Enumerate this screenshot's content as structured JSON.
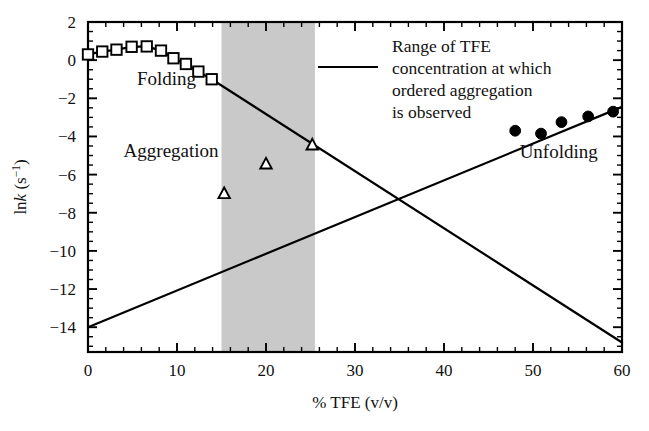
{
  "chart_data": {
    "type": "scatter",
    "title": "",
    "xlabel": "% TFE (v/v)",
    "ylabel": "ln k (s⁻¹)",
    "xlim": [
      0,
      60
    ],
    "ylim": [
      -15.3,
      2
    ],
    "xticks": [
      0,
      10,
      20,
      30,
      40,
      50,
      60
    ],
    "xticklabels": [
      "0",
      "10",
      "20",
      "30",
      "40",
      "50",
      "60"
    ],
    "yticks": [
      2,
      0,
      -2,
      -4,
      -6,
      -8,
      -10,
      -12,
      -14
    ],
    "yticklabels": [
      "2",
      "0",
      "−2",
      "−4",
      "−6",
      "−8",
      "−10",
      "−12",
      "−14"
    ],
    "x_minor_step": 2,
    "y_minor_step": 0.5,
    "grid": false,
    "legend_position": "inside-upper-right",
    "shaded_region": {
      "label": "Range of TFE concentration at which ordered aggregation is observed",
      "x_start": 15,
      "x_end": 25.5,
      "color": "#c9c9c9"
    },
    "series": [
      {
        "name": "Folding",
        "marker": "open-square",
        "label_text": "Folding",
        "label_x": 5.5,
        "label_y": -1.3,
        "points": [
          {
            "x": 0.0,
            "y": 0.3
          },
          {
            "x": 1.6,
            "y": 0.45
          },
          {
            "x": 3.2,
            "y": 0.55
          },
          {
            "x": 4.9,
            "y": 0.7
          },
          {
            "x": 6.6,
            "y": 0.72
          },
          {
            "x": 8.2,
            "y": 0.5
          },
          {
            "x": 9.6,
            "y": 0.1
          },
          {
            "x": 11.0,
            "y": -0.2
          },
          {
            "x": 12.4,
            "y": -0.6
          },
          {
            "x": 13.9,
            "y": -1.0
          }
        ]
      },
      {
        "name": "Aggregation",
        "marker": "open-triangle",
        "label_text": "Aggregation",
        "label_x": 4.0,
        "label_y": -5.1,
        "points": [
          {
            "x": 15.3,
            "y": -7.0
          },
          {
            "x": 20.0,
            "y": -5.45
          },
          {
            "x": 25.2,
            "y": -4.45
          }
        ]
      },
      {
        "name": "Unfolding",
        "marker": "filled-circle",
        "label_text": "Unfolding",
        "label_x": 48.5,
        "label_y": -5.15,
        "points": [
          {
            "x": 48.0,
            "y": -3.7
          },
          {
            "x": 50.9,
            "y": -3.85
          },
          {
            "x": 53.2,
            "y": -3.25
          },
          {
            "x": 56.2,
            "y": -2.95
          },
          {
            "x": 59.0,
            "y": -2.7
          }
        ]
      }
    ],
    "lines": [
      {
        "name": "folding-trend",
        "from": {
          "x": 13.9,
          "y": -1.0
        },
        "to": {
          "x": 60.0,
          "y": -14.8
        }
      },
      {
        "name": "unfolding-trend",
        "from": {
          "x": 0.0,
          "y": -14.0
        },
        "to": {
          "x": 60.0,
          "y": -2.45
        }
      }
    ]
  },
  "legend": {
    "lines": [
      "Range of TFE",
      "concentration at which",
      "ordered aggregation",
      "is observed"
    ]
  }
}
